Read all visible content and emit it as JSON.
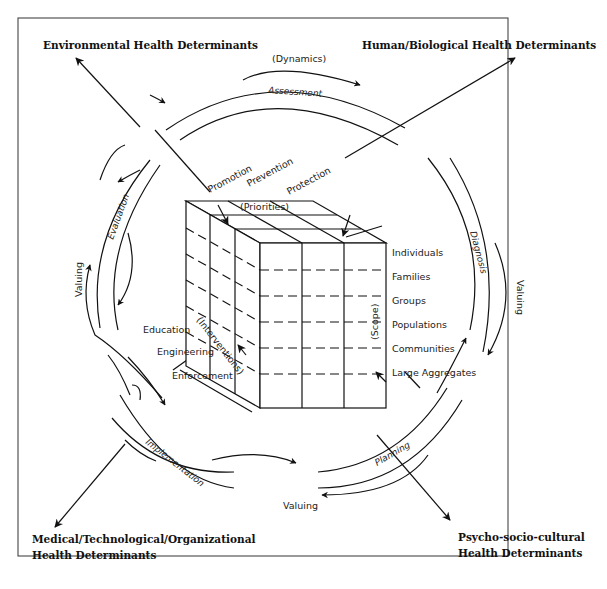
{
  "determinants": {
    "environmental": "Environmental Health Determinants",
    "human_biological": "Human/Biological Health Determinants",
    "medical_line1": "Medical/Technological/Organizational",
    "medical_line2": "Health Determinants",
    "psycho_line1": "Psycho-socio-cultural",
    "psycho_line2": "Health Determinants"
  },
  "cycle": {
    "dynamics": "(Dynamics)",
    "assessment": "Assessment",
    "diagnosis": "Diagnosis",
    "planning": "Planning",
    "implementation": "Implementation",
    "evaluation": "Evaluation",
    "valuing": [
      "Valuing",
      "Valuing",
      "Valuing"
    ]
  },
  "cube": {
    "priorities_label": "(Priorities)",
    "priorities": [
      "Promotion",
      "Prevention",
      "Protection"
    ],
    "interventions_label": "(Interventions)",
    "interventions": [
      "Education",
      "Engineering",
      "Enforcement"
    ],
    "scope_label": "(Scope)",
    "scope": [
      "Individuals",
      "Families",
      "Groups",
      "Populations",
      "Communities",
      "Large Aggregates"
    ]
  }
}
